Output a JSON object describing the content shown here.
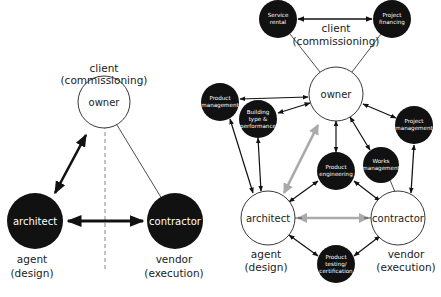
{
  "left_diagram": {
    "top_label": [
      "client",
      "(commissioning)"
    ],
    "nodes": {
      "owner": "owner",
      "architect": "architect",
      "contractor": "contractor"
    },
    "architect_caption": [
      "agent",
      "(design)"
    ],
    "contractor_caption": [
      "vendor",
      "(execution)"
    ]
  },
  "right_diagram": {
    "top_label": [
      "client",
      "(commissioning)"
    ],
    "main_nodes": {
      "owner": "owner",
      "architect": "architect",
      "contractor": "contractor"
    },
    "architect_caption": [
      "agent",
      "(design)"
    ],
    "contractor_caption": [
      "vendor",
      "(execution)"
    ],
    "service_nodes": {
      "service_rental": [
        "Service",
        "rental"
      ],
      "project_financing": [
        "Project",
        "financing"
      ],
      "product_management": [
        "Product",
        "management"
      ],
      "building_type": [
        "Building",
        "type &",
        "performance"
      ],
      "project_management": [
        "Project",
        "management"
      ],
      "product_engineering": [
        "Product",
        "engineering"
      ],
      "works_management": [
        "Works",
        "management"
      ],
      "product_testing": [
        "Product",
        "testing/",
        "certification"
      ]
    }
  },
  "colors": {
    "black": "#111111",
    "gray_arrow": "#aaaaaa",
    "line": "#222222"
  }
}
